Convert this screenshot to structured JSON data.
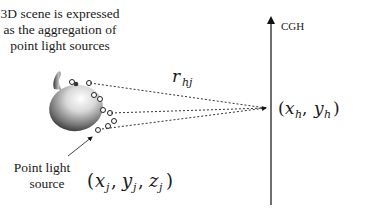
{
  "caption": {
    "line1": "3D scene is expressed",
    "line2": "as the aggregation of",
    "line3": "point light sources"
  },
  "hologram_label": "CGH",
  "distance_label": {
    "base": "r",
    "subscript": "hj"
  },
  "hologram_point": {
    "open": "(",
    "x": "x",
    "x_sub": "h",
    "comma": ", ",
    "y": "y",
    "y_sub": "h",
    "close": ")"
  },
  "point_source_label": {
    "line1": "Point light",
    "line2": "source"
  },
  "point_source_coords": {
    "open": "(",
    "x": "x",
    "x_sub": "j",
    "c1": ", ",
    "y": "y",
    "y_sub": "j",
    "c2": ", ",
    "z": "z",
    "z_sub": "j",
    "close": ")"
  },
  "colors": {
    "ink": "#1a1a1a",
    "line": "#333333"
  }
}
